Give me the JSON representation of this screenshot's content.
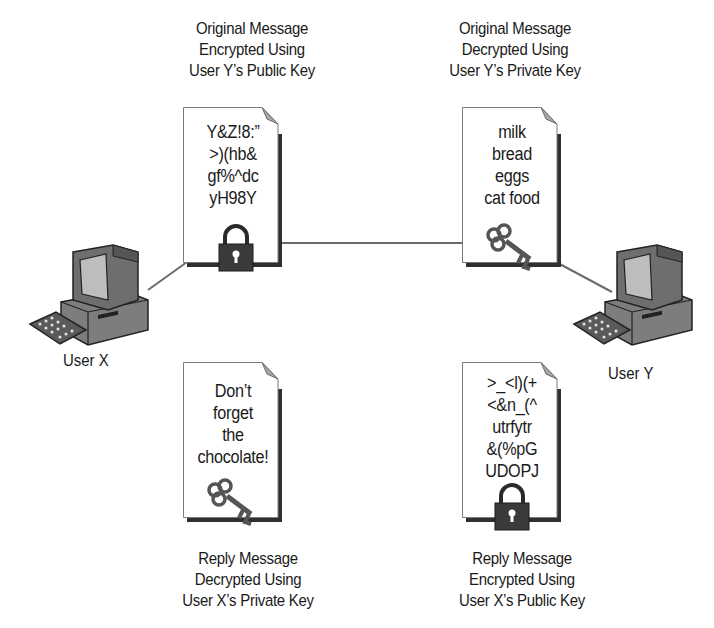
{
  "diagram": {
    "type": "public-key-encryption-exchange",
    "users": [
      {
        "id": "user-x",
        "label": "User X"
      },
      {
        "id": "user-y",
        "label": "User Y"
      }
    ],
    "documents": {
      "original_encrypted": {
        "caption": [
          "Original Message",
          "Encrypted Using",
          "User Y’s Public Key"
        ],
        "content": [
          "Y&Z!8:”",
          ">)(hb&",
          "gf%^dc",
          "yH98Y"
        ],
        "icon": "padlock-icon"
      },
      "original_decrypted": {
        "caption": [
          "Original Message",
          "Decrypted Using",
          "User Y’s Private Key"
        ],
        "content": [
          "milk",
          "bread",
          "eggs",
          "cat food"
        ],
        "icon": "key-icon"
      },
      "reply_decrypted": {
        "caption": [
          "Reply Message",
          "Decrypted Using",
          "User X’s Private Key"
        ],
        "content": [
          "Don’t",
          "forget",
          "the",
          "chocolate!"
        ],
        "icon": "key-icon"
      },
      "reply_encrypted": {
        "caption": [
          "Reply Message",
          "Encrypted Using",
          "User X’s Public Key"
        ],
        "content": [
          ">_<l)(+",
          "<&n_(^",
          "utrfytr",
          "&(%pG",
          "UDOPJ"
        ],
        "icon": "padlock-icon"
      }
    },
    "colors": {
      "line": "#6b6b6b",
      "doc_border": "#7a7a7a",
      "doc_shadow": "#2f2f2f",
      "text": "#1a1a1a",
      "background": "#ffffff"
    }
  }
}
